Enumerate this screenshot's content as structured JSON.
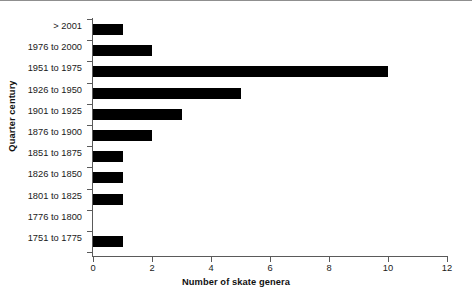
{
  "chart_data": {
    "type": "bar",
    "orientation": "horizontal",
    "title": "",
    "xlabel": "Number of skate genera",
    "ylabel": "Quarter century",
    "categories": [
      "> 2001",
      "1976 to 2000",
      "1951 to 1975",
      "1926 to 1950",
      "1901 to 1925",
      "1876 to 1900",
      "1851 to 1875",
      "1826 to 1850",
      "1801 to 1825",
      "1776 to 1800",
      "1751 to 1775"
    ],
    "values": [
      1,
      2,
      10,
      5,
      3,
      2,
      1,
      1,
      1,
      0,
      1
    ],
    "xlim": [
      0,
      12
    ],
    "xticks": [
      0,
      2,
      4,
      6,
      8,
      10,
      12
    ],
    "xticklabels": [
      "0",
      "2",
      "4",
      "6",
      "8",
      "10",
      "12"
    ],
    "grid": false,
    "legend": null,
    "bar_color": "#000000",
    "axis_color": "#5a5a5a",
    "background": "#ffffff"
  }
}
